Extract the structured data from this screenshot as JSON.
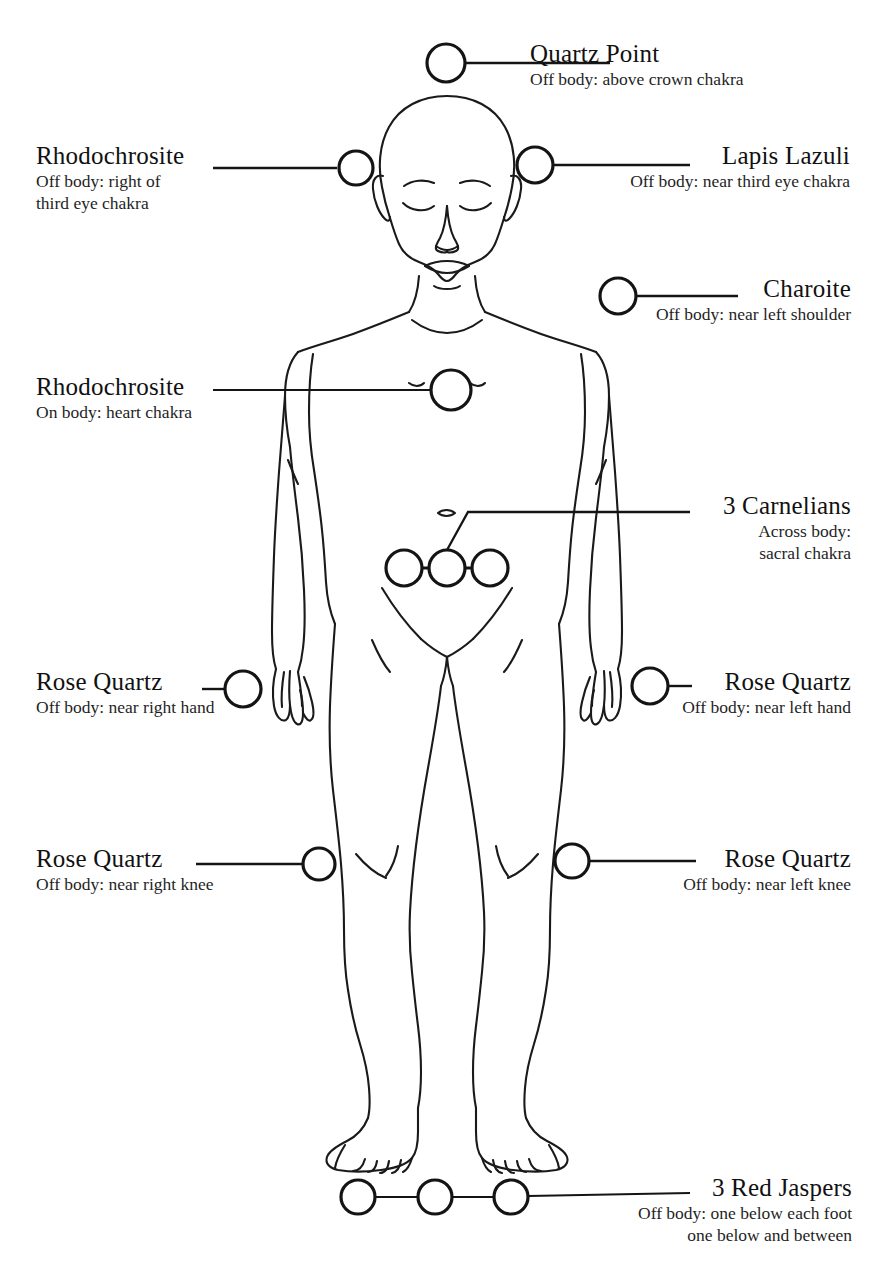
{
  "diagram": {
    "kind": "crystal-layout-body-map",
    "body_figure": "human-body-outline-front-view",
    "width": 891,
    "height": 1284,
    "background_color": "#ffffff",
    "line_color": "#1a1a1a",
    "marker_shape": "circle-outline"
  },
  "markers": {
    "quartz_point": {
      "label": "Quartz Point",
      "note": "Off body: above crown chakra"
    },
    "rhodochrosite_head": {
      "label": "Rhodochrosite",
      "note_line1": "Off body: right of",
      "note_line2": "third eye chakra"
    },
    "lapis_lazuli": {
      "label": "Lapis Lazuli",
      "note": "Off body: near third eye chakra"
    },
    "charoite": {
      "label": "Charoite",
      "note": "Off body: near left shoulder"
    },
    "rhodochrosite_heart": {
      "label": "Rhodochrosite",
      "note": "On body: heart chakra"
    },
    "carnelians": {
      "label": "3 Carnelians",
      "note_line1": "Across body:",
      "note_line2": "sacral chakra",
      "count": 3
    },
    "rose_quartz_right_hand": {
      "label": "Rose Quartz",
      "note": "Off body: near right hand"
    },
    "rose_quartz_left_hand": {
      "label": "Rose Quartz",
      "note": "Off body: near left hand"
    },
    "rose_quartz_right_knee": {
      "label": "Rose Quartz",
      "note": "Off body: near right knee"
    },
    "rose_quartz_left_knee": {
      "label": "Rose Quartz",
      "note": "Off body: near left knee"
    },
    "red_jaspers": {
      "label": "3 Red Jaspers",
      "note_line1": "Off body: one below each foot",
      "note_line2": "one below and between",
      "count": 3
    }
  }
}
